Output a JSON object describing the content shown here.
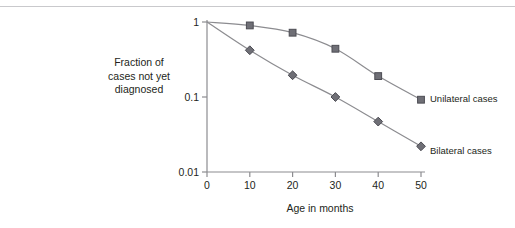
{
  "figure": {
    "has_top_rule": true,
    "background": "#ffffff",
    "text_color": "#231f20"
  },
  "axes": {
    "y_title_lines": [
      "Fraction of",
      "cases not yet",
      "diagnosed"
    ],
    "x_title": "Age in months",
    "y_ticks": [
      "1",
      "0.1",
      "0.01"
    ],
    "x_ticks": [
      "0",
      "10",
      "20",
      "30",
      "40",
      "50"
    ],
    "axis_color": "#8c8c90"
  },
  "legend": {
    "unilateral_label": "Unilateral cases",
    "bilateral_label": "Bilateral cases"
  },
  "chart_data": {
    "type": "line",
    "title": "",
    "subtitle": "",
    "xlabel": "Age in months",
    "ylabel": "Fraction of cases not yet diagnosed",
    "x": [
      0,
      10,
      20,
      30,
      40,
      50
    ],
    "xlim": [
      0,
      50
    ],
    "ylim": [
      0.01,
      1
    ],
    "yscale": "log",
    "y_tick_values": [
      1,
      0.1,
      0.01
    ],
    "x_tick_values": [
      0,
      10,
      20,
      30,
      40,
      50
    ],
    "grid": false,
    "legend_position": "right-of-curve-ends",
    "series": [
      {
        "name": "Unilateral cases",
        "marker": "square",
        "color": "#6f6f76",
        "line_color": "#8c8c90",
        "values": [
          1.0,
          0.9,
          0.72,
          0.44,
          0.19,
          0.092
        ]
      },
      {
        "name": "Bilateral cases",
        "marker": "diamond",
        "color": "#6f6f76",
        "line_color": "#8c8c90",
        "values": [
          1.0,
          0.42,
          0.195,
          0.1,
          0.047,
          0.022
        ]
      }
    ]
  }
}
